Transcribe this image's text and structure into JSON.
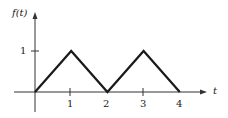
{
  "chart_data": {
    "type": "line",
    "title": "",
    "xlabel": "t",
    "ylabel": "f(t)",
    "x": [
      0,
      1,
      2,
      3,
      4
    ],
    "series": [
      {
        "name": "f(t)",
        "values": [
          0,
          1,
          0,
          1,
          0
        ]
      }
    ],
    "xticks": [
      "1",
      "2",
      "3",
      "4"
    ],
    "yticks": [
      "1"
    ],
    "xlim": [
      0,
      4.8
    ],
    "ylim": [
      0,
      1.4
    ],
    "grid": false,
    "legend": null,
    "colors": {
      "line": "#1a1a1a",
      "axis": "#333333"
    }
  },
  "labels": {
    "ylabel": "f(t)",
    "xlabel": "t",
    "ytick_1": "1",
    "xtick_1": "1",
    "xtick_2": "2",
    "xtick_3": "3",
    "xtick_4": "4"
  }
}
